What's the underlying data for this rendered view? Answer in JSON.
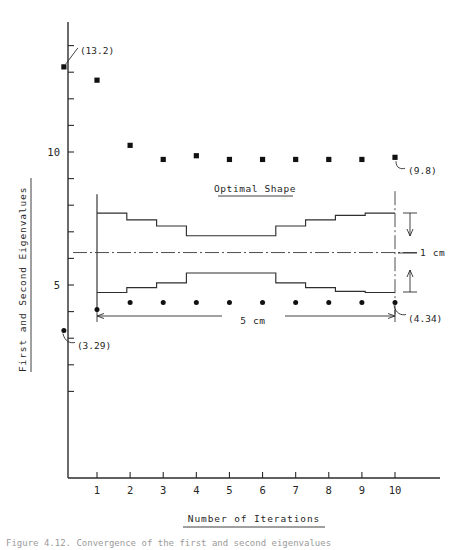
{
  "chart_data": {
    "type": "scatter",
    "title": "",
    "xlabel": "Number of Iterations",
    "ylabel": "First and Second Eigenvalues",
    "xlim": [
      -0.9,
      11.0
    ],
    "ylim": [
      0.0,
      15.6
    ],
    "x_ticks": [
      1,
      2,
      3,
      4,
      5,
      6,
      7,
      8,
      9,
      10
    ],
    "x_tick_labels": [
      "1",
      "2",
      "3",
      "4",
      "5",
      "6",
      "7",
      "8",
      "9",
      "10"
    ],
    "y_ticks": [
      1,
      2,
      3,
      4,
      5,
      6,
      7,
      8,
      9,
      10,
      11,
      12,
      13,
      14,
      15
    ],
    "y_tick_labels": [
      {
        "value": 5,
        "label": "5"
      },
      {
        "value": 10,
        "label": "10"
      }
    ],
    "grid": false,
    "legend": "none",
    "series": [
      {
        "name": "First eigenvalue",
        "marker": "square",
        "x": [
          0,
          1,
          2,
          3,
          4,
          5,
          6,
          7,
          8,
          9,
          10
        ],
        "y": [
          13.2,
          12.7,
          10.25,
          9.72,
          9.86,
          9.72,
          9.72,
          9.72,
          9.72,
          9.72,
          9.8
        ]
      },
      {
        "name": "Second eigenvalue",
        "marker": "circle",
        "x": [
          0,
          1,
          2,
          3,
          4,
          5,
          6,
          7,
          8,
          9,
          10
        ],
        "y": [
          3.29,
          4.08,
          4.34,
          4.34,
          4.34,
          4.34,
          4.34,
          4.34,
          4.34,
          4.34,
          4.34
        ]
      }
    ],
    "annotations": [
      {
        "text": "(13.2)",
        "point_x": 0,
        "point_y": 13.2,
        "position": "upper-right"
      },
      {
        "text": "(9.8)",
        "point_x": 10,
        "point_y": 9.8,
        "position": "right"
      },
      {
        "text": "(3.29)",
        "point_x": 0,
        "point_y": 3.29,
        "position": "lower-right"
      },
      {
        "text": "(4.34)",
        "point_x": 10,
        "point_y": 4.34,
        "position": "lower-right"
      }
    ]
  },
  "inset": {
    "title": "Optimal Shape",
    "length_label": "5 cm",
    "height_label": "1 cm",
    "n_segments": 10,
    "upper_profile": [
      7.7,
      7.7,
      7.45,
      7.22,
      6.85,
      6.85,
      6.85,
      7.22,
      7.45,
      7.62,
      7.7
    ],
    "lower_profile": [
      4.72,
      4.72,
      4.9,
      5.08,
      5.45,
      5.45,
      5.45,
      5.08,
      4.9,
      4.76,
      4.72
    ],
    "centerline_value": 6.22,
    "x_start": 1,
    "x_end": 10
  },
  "caption": {
    "text": "Figure 4.12.  Convergence of the first and second eigenvalues"
  }
}
